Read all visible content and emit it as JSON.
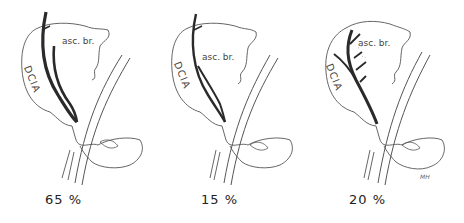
{
  "figure": {
    "panels": [
      {
        "id": "variant-1",
        "percentage": "65 %",
        "label_branch": "asc. br.",
        "label_artery": "DCIA"
      },
      {
        "id": "variant-2",
        "percentage": "15 %",
        "label_branch": "asc. br.",
        "label_artery": "DCIA"
      },
      {
        "id": "variant-3",
        "percentage": "20 %",
        "label_branch": "asc. br.",
        "label_artery": "DCIA"
      }
    ],
    "signature": "MH"
  },
  "colors": {
    "outline": "#555555",
    "artery": "#2a2a2a",
    "background": "#ffffff"
  }
}
